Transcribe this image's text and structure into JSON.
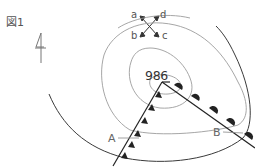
{
  "figure": {
    "label": "図1",
    "central_pressure": "986",
    "directions": {
      "a": "a",
      "b": "b",
      "c": "c",
      "d": "d"
    },
    "points": {
      "A": "A",
      "B": "B"
    },
    "elements": {
      "north_arrow": "north-arrow-symbol",
      "low_pressure_center": "low-center",
      "cold_front": "cold-front-with-triangles",
      "warm_front": "warm-front-with-semicircles",
      "isobars": "concentric-isobar-lines"
    },
    "colors": {
      "front_line": "#333333",
      "front_symbol": "#222222",
      "isobar": "#9a9a9a",
      "outer_curve": "#444444",
      "text": "#555555"
    }
  }
}
